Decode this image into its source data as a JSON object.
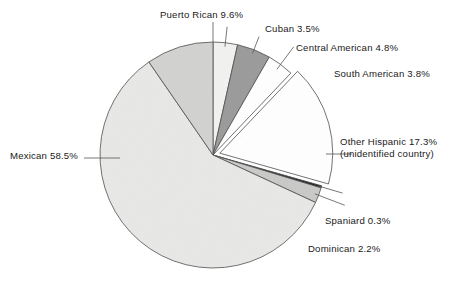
{
  "chart_data": {
    "type": "pie",
    "title": "",
    "subtitle": "",
    "xlabel": "",
    "ylabel": "",
    "legend_position": "none",
    "grid": false,
    "units": "percent",
    "start_angle_deg": 0,
    "direction": "clockwise",
    "categories": [
      "Cuban",
      "Central American",
      "South American",
      "Other Hispanic",
      "Spaniard",
      "Dominican",
      "Mexican",
      "Puerto Rican"
    ],
    "values": [
      3.5,
      4.8,
      3.8,
      17.3,
      0.3,
      2.2,
      58.5,
      9.6
    ],
    "slices": [
      {
        "name": "Cuban",
        "value": 3.5,
        "label": "Cuban 3.5%",
        "color": "#f2f2f0",
        "exploded": false
      },
      {
        "name": "Central American",
        "value": 4.8,
        "label": "Central American 4.8%",
        "color": "#9a9a9a",
        "exploded": false
      },
      {
        "name": "South American",
        "value": 3.8,
        "label": "South American 3.8%",
        "color": "#ffffff",
        "exploded": false
      },
      {
        "name": "Other Hispanic",
        "value": 17.3,
        "label": "Other Hispanic 17.3%",
        "sublabel": "(unidentified country)",
        "color": "#ffffff",
        "exploded": true
      },
      {
        "name": "Spaniard",
        "value": 0.3,
        "label": "Spaniard 0.3%",
        "color": "#141414",
        "exploded": false
      },
      {
        "name": "Dominican",
        "value": 2.2,
        "label": "Dominican 2.2%",
        "color": "#c9c9c7",
        "exploded": false
      },
      {
        "name": "Mexican",
        "value": 58.5,
        "label": "Mexican 58.5%",
        "color": "#e8e8e6",
        "exploded": false
      },
      {
        "name": "Puerto Rican",
        "value": 9.6,
        "label": "Puerto Rican 9.6%",
        "color": "#d2d2d0",
        "exploded": false
      }
    ]
  },
  "labels": {
    "puerto_rican": "Puerto Rican 9.6%",
    "cuban": "Cuban 3.5%",
    "central_american": "Central American 4.8%",
    "south_american": "South American 3.8%",
    "other_hispanic": "Other Hispanic 17.3%",
    "other_hispanic_sub": "(unidentified country)",
    "mexican": "Mexican 58.5%",
    "spaniard": "Spaniard 0.3%",
    "dominican": "Dominican 2.2%"
  },
  "colors": {
    "outline": "#4a4a4a",
    "leader": "#555555",
    "text": "#1a1a1a",
    "background": "#ffffff"
  }
}
